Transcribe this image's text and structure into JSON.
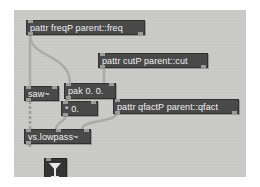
{
  "window": {
    "app": "Max/MSP",
    "title": "patcher",
    "canvas_color": "#c9c9c6",
    "object_fill": "#454545",
    "object_text": "#f2f2f2",
    "cord_color": "#a8a8a5"
  },
  "objects": [
    {
      "id": "pattr-freqp",
      "name": "pattr-freqp-object",
      "text": "pattr freqP parent::freq",
      "x": 26,
      "y": 20,
      "w": 119,
      "h": 15,
      "inlets": 1,
      "outlets": 2
    },
    {
      "id": "pattr-cutp",
      "name": "pattr-cutp-object",
      "text": "pattr cutP parent::cut",
      "x": 98,
      "y": 53,
      "w": 110,
      "h": 15,
      "inlets": 1,
      "outlets": 2
    },
    {
      "id": "saw",
      "name": "saw-object",
      "text": "saw~",
      "x": 27,
      "y": 86,
      "w": 33,
      "h": 14,
      "inlets": 2,
      "outlets": 1
    },
    {
      "id": "pak",
      "name": "pak-object",
      "text": "pak 0. 0.",
      "x": 64,
      "y": 83,
      "w": 50,
      "h": 15,
      "inlets": 2,
      "outlets": 1
    },
    {
      "id": "times",
      "name": "multiply-object",
      "text": "* 0.",
      "x": 62,
      "y": 101,
      "w": 35,
      "h": 14,
      "inlets": 2,
      "outlets": 1
    },
    {
      "id": "pattr-qfactp",
      "name": "pattr-qfactp-object",
      "text": "pattr qfactP parent::qfact",
      "x": 113,
      "y": 99,
      "w": 125,
      "h": 15,
      "inlets": 1,
      "outlets": 2
    },
    {
      "id": "vs-lowpass",
      "name": "vs-lowpass-object",
      "text": "vs.lowpass~",
      "x": 26,
      "y": 129,
      "w": 65,
      "h": 14,
      "inlets": 3,
      "outlets": 1
    }
  ],
  "widgets": [
    {
      "id": "dac",
      "name": "ezdac-widget",
      "icon": "speaker-icon",
      "label": "1",
      "x": 30,
      "y": 148,
      "w": 21,
      "h": 23
    }
  ],
  "cords": [
    {
      "from": "pattr-freqp.outlet0",
      "to": "saw.inlet0"
    },
    {
      "from": "pattr-freqp.outlet0",
      "to": "pak.inlet0"
    },
    {
      "from": "pattr-cutp.outlet0",
      "to": "pak.inlet1"
    },
    {
      "from": "pak.outlet0",
      "to": "times.inlet0"
    },
    {
      "from": "saw.outlet0",
      "to": "vs-lowpass.inlet0"
    },
    {
      "from": "times.outlet0",
      "to": "vs-lowpass.inlet1"
    },
    {
      "from": "pattr-qfactp.outlet0",
      "to": "vs-lowpass.inlet2"
    },
    {
      "from": "vs-lowpass.outlet0",
      "to": "dac.inlet0"
    }
  ]
}
